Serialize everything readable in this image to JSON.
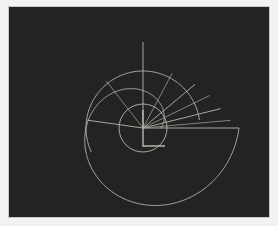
{
  "figure": {
    "title": "",
    "background_color": "#ffffff",
    "panel_color": "#f2f2f2",
    "plot_background_color": "#232323",
    "frame_border_color": "#c9c9c9",
    "stroke_color": "#b9b6ac",
    "stroke_color_dim": "#8e8c84",
    "stroke_width": 0.9
  },
  "chart_data": {
    "type": "line",
    "title": "",
    "subtitle": "",
    "xlabel": "",
    "ylabel": "",
    "grid": false,
    "legend": "none",
    "coordinate_system": "polar",
    "axis_ticks_visible": false,
    "tick_labels": [],
    "legend_entries": [],
    "annotations": [],
    "center": {
      "x": 143,
      "y": 128
    },
    "xlim": [
      0,
      278
    ],
    "ylim": [
      0,
      226
    ],
    "series": [
      {
        "name": "outer-spiral",
        "type": "spiral",
        "turns": 1.0,
        "r_start": 18,
        "r_end": 96,
        "theta_start_deg": 0,
        "theta_end_deg": 360
      },
      {
        "name": "inner-circle",
        "type": "circle",
        "radius": 24
      },
      {
        "name": "mid-arc",
        "type": "arc",
        "radius": 57,
        "theta_start_deg": 8,
        "theta_end_deg": 205
      }
    ],
    "spokes": {
      "name": "radial-spokes",
      "count": 9,
      "angles_deg": [
        0,
        5,
        14,
        26,
        40,
        62,
        90,
        128,
        172
      ],
      "radii": [
        96,
        88,
        80,
        74,
        68,
        62,
        86,
        60,
        56
      ]
    },
    "center_marker": {
      "name": "right-angle-corner",
      "arm_length_x": 22,
      "arm_length_y": 18
    }
  }
}
